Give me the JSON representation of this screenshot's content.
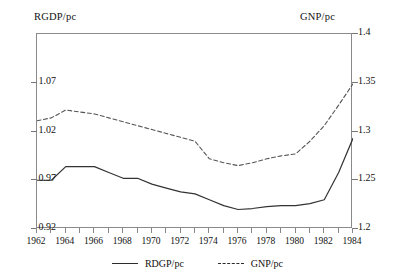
{
  "axes": {
    "left_title": "RGDP/pc",
    "right_title": "GNP/pc",
    "left_ticks": [
      "1.07",
      "1.02",
      "0.97",
      "0.92"
    ],
    "right_ticks": [
      "1.4",
      "1.35",
      "1.3",
      "1.25",
      "1.2"
    ],
    "x_ticks": [
      "1962",
      "1964",
      "1966",
      "1968",
      "1970",
      "1972",
      "1974",
      "1976",
      "1978",
      "1980",
      "1982",
      "1984"
    ]
  },
  "legend": {
    "items": [
      {
        "label": "RDGP/pc",
        "style": "solid"
      },
      {
        "label": "GNP/pc",
        "style": "dashed"
      }
    ]
  },
  "chart_data": {
    "type": "line",
    "title": "",
    "xlabel": "",
    "ylabel": "RGDP/pc",
    "y2label": "GNP/pc",
    "grid": false,
    "legend_position": "bottom",
    "xlim": [
      1962,
      1984
    ],
    "ylim": [
      0.92,
      1.12
    ],
    "y2lim": [
      1.2,
      1.4
    ],
    "x": [
      1962,
      1963,
      1964,
      1965,
      1966,
      1967,
      1968,
      1969,
      1970,
      1971,
      1972,
      1973,
      1974,
      1975,
      1976,
      1977,
      1978,
      1979,
      1980,
      1981,
      1982,
      1983,
      1984
    ],
    "series": [
      {
        "name": "RDGP/pc",
        "axis": "left",
        "style": "solid",
        "color": "#333333",
        "values": [
          0.97,
          0.97,
          0.984,
          0.984,
          0.984,
          0.978,
          0.972,
          0.972,
          0.966,
          0.962,
          0.958,
          0.956,
          0.95,
          0.944,
          0.94,
          0.941,
          0.943,
          0.944,
          0.944,
          0.946,
          0.95,
          0.978,
          1.013
        ]
      },
      {
        "name": "GNP/pc",
        "axis": "right",
        "style": "dashed",
        "color": "#555555",
        "values": [
          1.311,
          1.314,
          1.322,
          1.32,
          1.318,
          1.314,
          1.31,
          1.306,
          1.302,
          1.298,
          1.294,
          1.29,
          1.272,
          1.268,
          1.265,
          1.268,
          1.272,
          1.275,
          1.277,
          1.29,
          1.306,
          1.327,
          1.349
        ]
      }
    ]
  }
}
